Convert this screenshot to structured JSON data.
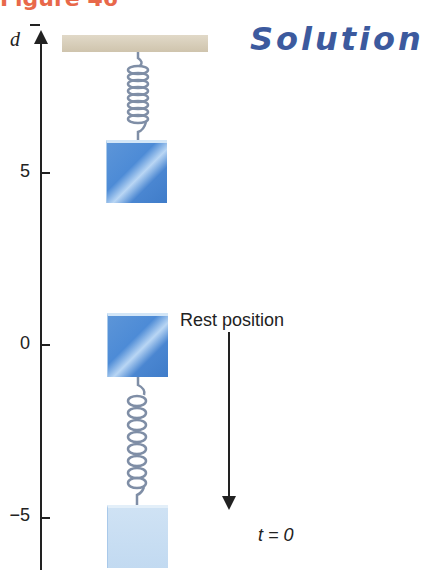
{
  "figure": {
    "label": "Figure 46",
    "heading": "Solution",
    "colors": {
      "figure_label": "#e8684a",
      "heading": "#3c5a9e",
      "mass": "#4d8bd6",
      "mass_light": "#c2daf1",
      "spring": "#7f8ea6",
      "ceiling": "#d8cfbb"
    }
  },
  "axis": {
    "variable": "d",
    "ticks": [
      {
        "value": "5",
        "y": 172
      },
      {
        "value": "0",
        "y": 344
      },
      {
        "value": "−5",
        "y": 517
      }
    ]
  },
  "annotations": {
    "rest_position": "Rest position",
    "time": "t = 0"
  },
  "masses": [
    {
      "state": "compressed (d = 5)"
    },
    {
      "state": "rest position (d = 0)"
    },
    {
      "state": "released at t = 0 (d = −5)"
    }
  ]
}
